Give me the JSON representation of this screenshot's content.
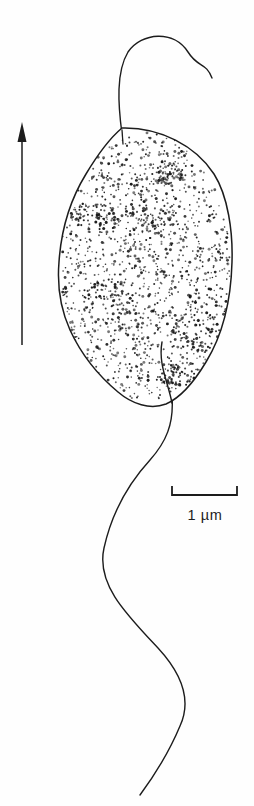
{
  "figure": {
    "domain_kind": "scientific-line-drawing",
    "background_color": "#fefefe",
    "ink_color": "#1c1c1c",
    "width": 254,
    "height": 806
  },
  "scale_bar": {
    "label": "1 µm",
    "value": 1,
    "unit": "µm",
    "x_start": 172,
    "x_end": 237,
    "y": 495,
    "tick_height": 9,
    "label_x": 205,
    "label_y": 517
  },
  "orientation_arrow": {
    "name": "direction-arrow",
    "tip_x": 22,
    "tip_y": 122,
    "tail_x": 22,
    "tail_y": 345,
    "head_width": 9,
    "head_length": 20
  },
  "cell_body": {
    "name": "cell-body-outline",
    "center_x": 145,
    "center_y": 266,
    "left": 58,
    "right": 233,
    "top": 128,
    "bottom": 405,
    "fill": "#ffffff",
    "stroke": "#1c1c1c",
    "stroke_width": 1.5,
    "stipple_description": "dense stippled cytoplasm, heavier near margins"
  },
  "anterior_flagellum": {
    "name": "anterior-flagellum",
    "origin_x": 122,
    "origin_y": 128,
    "apex_y": 38,
    "tip_x": 212,
    "tip_y": 78,
    "stroke_width": 1.4
  },
  "posterior_flagellum": {
    "name": "posterior-flagellum",
    "root_x": 162,
    "root_y": 342,
    "exit_x": 172,
    "exit_y": 405,
    "tip_x": 140,
    "tip_y": 795,
    "stroke_width": 1.4
  }
}
